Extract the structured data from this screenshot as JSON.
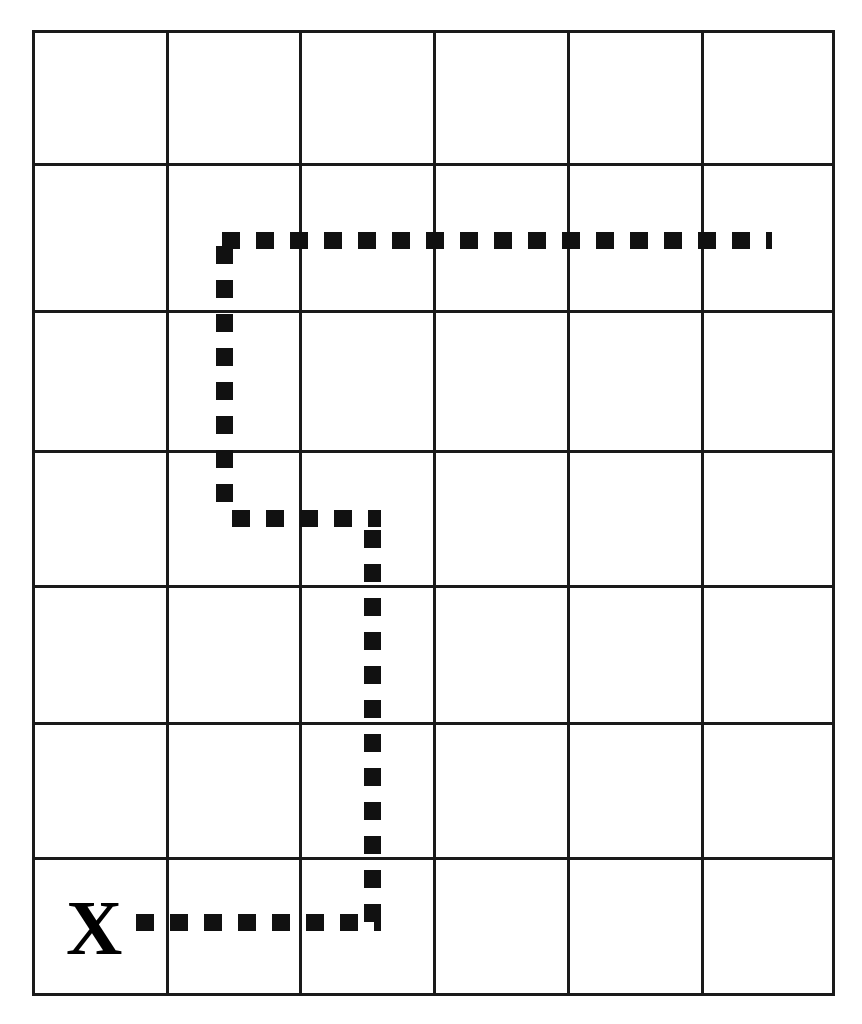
{
  "diagram": {
    "background_color": "#ffffff",
    "line_color": "#1a1a1a",
    "path_color": "#111111",
    "grid": {
      "columns": 6,
      "rows": 7,
      "left": 33,
      "top": 31,
      "right": 833,
      "bottom": 994,
      "column_edges": [
        33,
        167,
        300,
        434,
        568,
        702,
        833
      ],
      "row_edges": [
        31,
        164,
        311,
        451,
        586,
        723,
        858,
        994
      ],
      "line_width": 3
    },
    "start_marker": {
      "label": "X",
      "icon_name": "x-start-marker",
      "cell_column": 1,
      "cell_row": 7,
      "x": 66,
      "y": 889,
      "font_size": 78
    },
    "path": {
      "name": "dashed-route",
      "style": "dashed",
      "dash_length": 18,
      "dash_gap": 16,
      "stroke_width": 17,
      "description": "Dashed route starting at X in the bottom-left cell, running right, then up, then left, then up, then right to the far edge.",
      "waypoints": [
        {
          "x": 136,
          "y": 922,
          "note": "start beside X marker"
        },
        {
          "x": 381,
          "y": 922,
          "note": "corner: turn upward"
        },
        {
          "x": 381,
          "y": 527,
          "note": "corner: turn left (jog)"
        },
        {
          "x": 232,
          "y": 508,
          "note": "corner: turn upward"
        },
        {
          "x": 232,
          "y": 240,
          "note": "corner: turn right"
        },
        {
          "x": 772,
          "y": 240,
          "note": "route end near right edge"
        }
      ],
      "segments": [
        {
          "name": "segment-bottom-horizontal",
          "orientation": "horizontal",
          "from_x": 136,
          "to_x": 381,
          "y": 922
        },
        {
          "name": "segment-right-vertical",
          "orientation": "vertical",
          "x": 372,
          "from_y": 530,
          "to_y": 930
        },
        {
          "name": "segment-middle-jog",
          "orientation": "horizontal",
          "from_x": 232,
          "to_x": 381,
          "y": 518
        },
        {
          "name": "segment-left-vertical",
          "orientation": "vertical",
          "x": 224,
          "from_y": 246,
          "to_y": 516
        },
        {
          "name": "segment-top-horizontal",
          "orientation": "horizontal",
          "from_x": 222,
          "to_x": 772,
          "y": 240
        }
      ]
    }
  }
}
